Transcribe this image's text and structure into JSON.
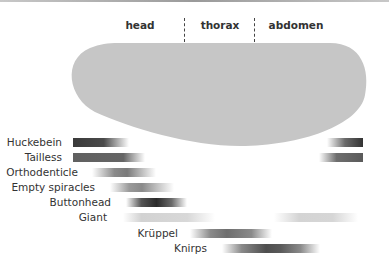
{
  "diagram": {
    "regions": [
      {
        "label": "head",
        "x": 140
      },
      {
        "label": "thorax",
        "x": 220
      },
      {
        "label": "abdomen",
        "x": 296
      }
    ],
    "dividers": [
      184,
      254
    ],
    "embryo_color": "#c6c6c6",
    "genes": [
      {
        "name": "Huckebein",
        "label_right": 62,
        "y": 137,
        "bars": [
          {
            "x": 73,
            "w": 56,
            "gradient": "linear-gradient(to right, #3a3a3a 0%, #4a4a4a 55%, rgba(90,90,90,0) 100%)"
          },
          {
            "x": 327,
            "w": 36,
            "gradient": "linear-gradient(to right, rgba(90,90,90,0) 0%, #6a6a6a 50%, #333 100%)"
          }
        ]
      },
      {
        "name": "Tailless",
        "label_right": 62,
        "y": 152,
        "bars": [
          {
            "x": 73,
            "w": 72,
            "gradient": "linear-gradient(to right, #606060 0%, #656565 70%, rgba(110,110,110,0) 100%)"
          },
          {
            "x": 319,
            "w": 44,
            "gradient": "linear-gradient(to right, rgba(110,110,110,0) 0%, #6e6e6e 40%, #5a5a5a 100%)"
          }
        ]
      },
      {
        "name": "Orthodenticle",
        "label_right": 78,
        "y": 167,
        "bars": [
          {
            "x": 92,
            "w": 64,
            "gradient": "linear-gradient(to right, rgba(120,120,120,0) 0%, #8a8a8a 35%, #7a7a7a 55%, rgba(150,150,150,0) 100%)"
          }
        ]
      },
      {
        "name": "Empty spiracles",
        "label_right": 95,
        "y": 182,
        "bars": [
          {
            "x": 110,
            "w": 64,
            "gradient": "linear-gradient(to right, rgba(140,140,140,0) 0%, #9a9a9a 30%, #8a8a8a 50%, rgba(160,160,160,0) 100%)"
          }
        ]
      },
      {
        "name": "Buttonhead",
        "label_right": 111,
        "y": 197,
        "bars": [
          {
            "x": 126,
            "w": 61,
            "gradient": "linear-gradient(to right, rgba(100,100,100,0) 0%, #555 25%, #2a2a2a 50%, #6a6a6a 75%, rgba(150,150,150,0) 100%)"
          }
        ]
      },
      {
        "name": "Giant",
        "label_right": 107,
        "y": 212,
        "bars": [
          {
            "x": 123,
            "w": 92,
            "gradient": "linear-gradient(to right, rgba(200,200,200,0) 0%, #d2d2d2 20%, #d8d8d8 70%, rgba(220,220,220,0) 100%)"
          },
          {
            "x": 274,
            "w": 84,
            "gradient": "linear-gradient(to right, rgba(200,200,200,0) 0%, #d4d4d4 30%, #d6d6d6 70%, rgba(220,220,220,0) 100%)"
          }
        ]
      },
      {
        "name": "Krüppel",
        "label_right": 178,
        "y": 228,
        "bars": [
          {
            "x": 190,
            "w": 82,
            "gradient": "linear-gradient(to right, rgba(140,140,140,0) 0%, #8a8a8a 25%, #6e6e6e 45%, #8a8a8a 75%, rgba(160,160,160,0) 100%)"
          }
        ]
      },
      {
        "name": "Knirps",
        "label_right": 207,
        "y": 243,
        "bars": [
          {
            "x": 222,
            "w": 98,
            "gradient": "linear-gradient(to right, rgba(140,140,140,0) 0%, #8a8a8a 20%, #4e4e4e 45%, #5a5a5a 60%, #8a8a8a 80%, rgba(170,170,170,0) 100%)"
          }
        ]
      }
    ]
  }
}
